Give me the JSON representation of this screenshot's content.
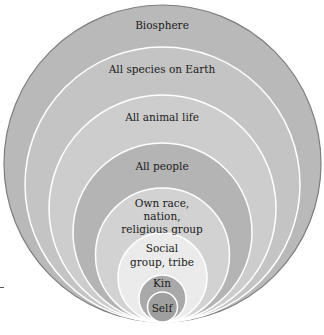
{
  "diagram": {
    "type": "nested-circles",
    "colors": {
      "outline": "#8a8a8a",
      "separator": "#ffffff",
      "text": "#1a1a1a"
    },
    "circles": [
      {
        "id": "biosphere",
        "lines": [
          "Biosphere"
        ],
        "fill": "#b9b9b9"
      },
      {
        "id": "all-species",
        "lines": [
          "All species on Earth"
        ],
        "fill": "#c4c4c4"
      },
      {
        "id": "all-animal-life",
        "lines": [
          "All animal life"
        ],
        "fill": "#cdcdcd"
      },
      {
        "id": "all-people",
        "lines": [
          "All people"
        ],
        "fill": "#b4b4b4"
      },
      {
        "id": "own-race",
        "lines": [
          "Own race,",
          "nation,",
          "religious group"
        ],
        "fill": "#d2d2d2"
      },
      {
        "id": "social-group",
        "lines": [
          "Social",
          "group, tribe"
        ],
        "fill": "#ebebeb"
      },
      {
        "id": "kin",
        "lines": [
          "Kin"
        ],
        "fill": "#a9a9a9"
      },
      {
        "id": "self",
        "lines": [
          "Self"
        ],
        "fill": "#9f9f9f"
      }
    ]
  }
}
